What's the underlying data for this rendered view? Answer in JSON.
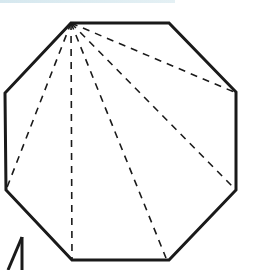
{
  "figure": {
    "type": "geometry-diagram",
    "colors": {
      "outline": "#1a1a1a",
      "diagonal": "#1a1a1a",
      "background": "#ffffff",
      "top_strip": "#d9eaf0"
    },
    "octagon": {
      "sides": 8,
      "vertices": [
        [
          71,
          23
        ],
        [
          169,
          23
        ],
        [
          236,
          92
        ],
        [
          236,
          190
        ],
        [
          169,
          260
        ],
        [
          72,
          260
        ],
        [
          6,
          190
        ],
        [
          5,
          93
        ]
      ],
      "stroke_width": 3
    },
    "diagonals": {
      "from_vertex": [
        71,
        23
      ],
      "count": 5,
      "style": "dashed",
      "endpoints": [
        [
          6,
          190
        ],
        [
          72,
          260
        ],
        [
          166,
          258
        ],
        [
          234,
          188
        ],
        [
          234,
          92
        ]
      ]
    },
    "partial_shape": {
      "description": "Partially visible triangle at bottom-left edge",
      "lines": [
        [
          [
            8,
            270
          ],
          [
            22,
            237
          ]
        ],
        [
          [
            22,
            237
          ],
          [
            22,
            270
          ]
        ]
      ]
    }
  }
}
